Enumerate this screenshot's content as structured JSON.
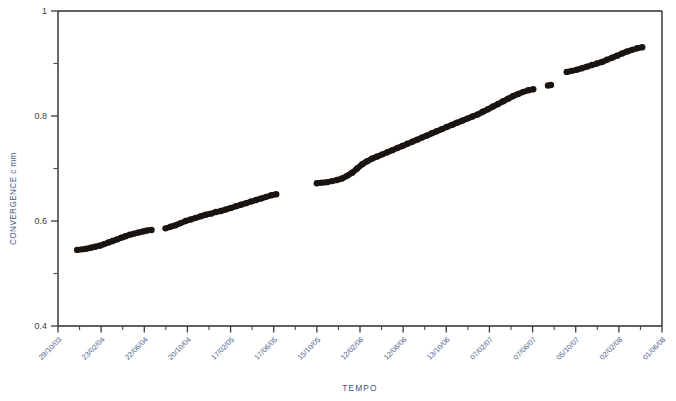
{
  "chart_data": {
    "type": "scatter",
    "title": "",
    "xlabel": "TEMPO",
    "ylabel": "CONVERGENCE c  mm",
    "ylim": [
      0.4,
      1
    ],
    "yticks": [
      "0.4",
      "0.6",
      "0.8",
      "1"
    ],
    "yticks_values": [
      0.4,
      0.6,
      0.8,
      1.0
    ],
    "yminor_values": [
      0.5,
      0.7,
      0.9
    ],
    "grid": false,
    "legend": null,
    "xtick_labels": [
      "29/10/03",
      "23/02/04",
      "22/06/04",
      "20/10/04",
      "17/02/05",
      "17/06/05",
      "15/10/05",
      "12/02/06",
      "12/06/06",
      "13/10/06",
      "07/02/07",
      "07/06/07",
      "05/10/07",
      "02/02/08",
      "01/06/08"
    ],
    "series": [
      {
        "name": "convergence",
        "marker": "filled-circle",
        "color": "#1a1410",
        "x_unit": "date",
        "points": [
          {
            "x": "2003-12-20",
            "y": 0.545
          },
          {
            "x": "2004-01-02",
            "y": 0.546
          },
          {
            "x": "2004-01-14",
            "y": 0.547
          },
          {
            "x": "2004-01-26",
            "y": 0.549
          },
          {
            "x": "2004-02-07",
            "y": 0.551
          },
          {
            "x": "2004-02-19",
            "y": 0.553
          },
          {
            "x": "2004-03-02",
            "y": 0.556
          },
          {
            "x": "2004-03-14",
            "y": 0.559
          },
          {
            "x": "2004-03-26",
            "y": 0.562
          },
          {
            "x": "2004-04-07",
            "y": 0.565
          },
          {
            "x": "2004-04-19",
            "y": 0.568
          },
          {
            "x": "2004-05-01",
            "y": 0.571
          },
          {
            "x": "2004-05-13",
            "y": 0.574
          },
          {
            "x": "2004-05-25",
            "y": 0.576
          },
          {
            "x": "2004-06-06",
            "y": 0.578
          },
          {
            "x": "2004-06-18",
            "y": 0.58
          },
          {
            "x": "2004-06-30",
            "y": 0.582
          },
          {
            "x": "2004-07-12",
            "y": 0.583
          },
          {
            "x": "2004-08-20",
            "y": 0.586
          },
          {
            "x": "2004-09-03",
            "y": 0.589
          },
          {
            "x": "2004-09-17",
            "y": 0.592
          },
          {
            "x": "2004-10-01",
            "y": 0.596
          },
          {
            "x": "2004-10-15",
            "y": 0.6
          },
          {
            "x": "2004-10-29",
            "y": 0.603
          },
          {
            "x": "2004-11-12",
            "y": 0.606
          },
          {
            "x": "2004-11-26",
            "y": 0.609
          },
          {
            "x": "2004-12-10",
            "y": 0.612
          },
          {
            "x": "2004-12-24",
            "y": 0.614
          },
          {
            "x": "2005-01-07",
            "y": 0.617
          },
          {
            "x": "2005-01-21",
            "y": 0.619
          },
          {
            "x": "2005-02-04",
            "y": 0.622
          },
          {
            "x": "2005-02-18",
            "y": 0.625
          },
          {
            "x": "2005-03-04",
            "y": 0.628
          },
          {
            "x": "2005-03-18",
            "y": 0.631
          },
          {
            "x": "2005-04-01",
            "y": 0.634
          },
          {
            "x": "2005-04-15",
            "y": 0.637
          },
          {
            "x": "2005-04-29",
            "y": 0.64
          },
          {
            "x": "2005-05-13",
            "y": 0.643
          },
          {
            "x": "2005-05-27",
            "y": 0.646
          },
          {
            "x": "2005-06-10",
            "y": 0.649
          },
          {
            "x": "2005-06-24",
            "y": 0.651
          },
          {
            "x": "2005-10-15",
            "y": 0.672
          },
          {
            "x": "2005-10-29",
            "y": 0.673
          },
          {
            "x": "2005-11-12",
            "y": 0.674
          },
          {
            "x": "2005-11-26",
            "y": 0.676
          },
          {
            "x": "2005-12-10",
            "y": 0.678
          },
          {
            "x": "2005-12-24",
            "y": 0.681
          },
          {
            "x": "2006-01-07",
            "y": 0.686
          },
          {
            "x": "2006-01-21",
            "y": 0.692
          },
          {
            "x": "2006-02-04",
            "y": 0.7
          },
          {
            "x": "2006-02-18",
            "y": 0.708
          },
          {
            "x": "2006-03-04",
            "y": 0.714
          },
          {
            "x": "2006-03-18",
            "y": 0.719
          },
          {
            "x": "2006-04-01",
            "y": 0.723
          },
          {
            "x": "2006-04-15",
            "y": 0.727
          },
          {
            "x": "2006-04-29",
            "y": 0.731
          },
          {
            "x": "2006-05-13",
            "y": 0.735
          },
          {
            "x": "2006-05-27",
            "y": 0.739
          },
          {
            "x": "2006-06-10",
            "y": 0.743
          },
          {
            "x": "2006-06-24",
            "y": 0.747
          },
          {
            "x": "2006-07-08",
            "y": 0.751
          },
          {
            "x": "2006-07-22",
            "y": 0.755
          },
          {
            "x": "2006-08-05",
            "y": 0.759
          },
          {
            "x": "2006-08-19",
            "y": 0.763
          },
          {
            "x": "2006-09-02",
            "y": 0.767
          },
          {
            "x": "2006-09-16",
            "y": 0.771
          },
          {
            "x": "2006-09-30",
            "y": 0.775
          },
          {
            "x": "2006-10-14",
            "y": 0.779
          },
          {
            "x": "2006-10-28",
            "y": 0.783
          },
          {
            "x": "2006-11-11",
            "y": 0.787
          },
          {
            "x": "2006-11-25",
            "y": 0.791
          },
          {
            "x": "2006-12-09",
            "y": 0.795
          },
          {
            "x": "2006-12-23",
            "y": 0.799
          },
          {
            "x": "2007-01-06",
            "y": 0.803
          },
          {
            "x": "2007-01-20",
            "y": 0.808
          },
          {
            "x": "2007-02-03",
            "y": 0.813
          },
          {
            "x": "2007-02-17",
            "y": 0.818
          },
          {
            "x": "2007-03-03",
            "y": 0.823
          },
          {
            "x": "2007-03-17",
            "y": 0.828
          },
          {
            "x": "2007-03-31",
            "y": 0.833
          },
          {
            "x": "2007-04-14",
            "y": 0.838
          },
          {
            "x": "2007-04-28",
            "y": 0.842
          },
          {
            "x": "2007-05-12",
            "y": 0.846
          },
          {
            "x": "2007-05-26",
            "y": 0.849
          },
          {
            "x": "2007-06-09",
            "y": 0.851
          },
          {
            "x": "2007-07-20",
            "y": 0.858
          },
          {
            "x": "2007-07-28",
            "y": 0.859
          },
          {
            "x": "2007-09-10",
            "y": 0.884
          },
          {
            "x": "2007-09-24",
            "y": 0.886
          },
          {
            "x": "2007-10-08",
            "y": 0.888
          },
          {
            "x": "2007-10-22",
            "y": 0.891
          },
          {
            "x": "2007-11-05",
            "y": 0.894
          },
          {
            "x": "2007-11-19",
            "y": 0.897
          },
          {
            "x": "2007-12-03",
            "y": 0.9
          },
          {
            "x": "2007-12-17",
            "y": 0.903
          },
          {
            "x": "2007-12-31",
            "y": 0.907
          },
          {
            "x": "2008-01-14",
            "y": 0.911
          },
          {
            "x": "2008-01-28",
            "y": 0.915
          },
          {
            "x": "2008-02-11",
            "y": 0.919
          },
          {
            "x": "2008-02-25",
            "y": 0.923
          },
          {
            "x": "2008-03-10",
            "y": 0.926
          },
          {
            "x": "2008-03-24",
            "y": 0.929
          },
          {
            "x": "2008-04-07",
            "y": 0.931
          }
        ]
      }
    ]
  }
}
